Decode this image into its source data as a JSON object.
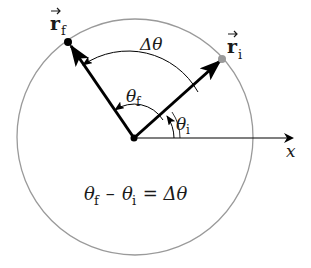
{
  "diagram": {
    "type": "angular-displacement",
    "labels": {
      "r_final": "r",
      "r_final_sub": "f",
      "r_initial": "r",
      "r_initial_sub": "i",
      "delta_theta": "Δθ",
      "theta_f": "θ",
      "theta_f_sub": "f",
      "theta_i": "θ",
      "theta_i_sub": "i",
      "x_axis": "x",
      "equation_theta1": "θ",
      "equation_sub1": "f",
      "equation_minus": " – ",
      "equation_theta2": "θ",
      "equation_sub2": "i",
      "equation_rhs": " = Δθ"
    },
    "colors": {
      "circle": "#9a9a9a",
      "vectors": "#000000",
      "initial_point": "#9a9a9a",
      "final_point": "#000000",
      "text": "#1a1a1a"
    }
  }
}
